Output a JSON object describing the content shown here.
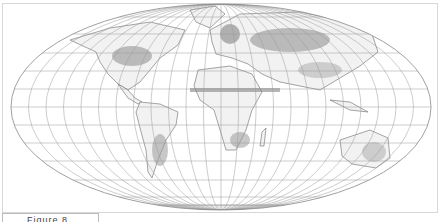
{
  "map": {
    "projection": "Mollweide",
    "graticule": {
      "meridian_step_deg": 15,
      "parallel_step_deg": 15
    },
    "colors": {
      "graticule": "#9a9a9a",
      "outline": "#888888",
      "land": "#f4f4f4",
      "coast": "#6a6a6a",
      "shade_dark": "#8c8c8c",
      "shade_light": "#c8c8c8"
    }
  },
  "caption": {
    "label": "Figure 8"
  }
}
